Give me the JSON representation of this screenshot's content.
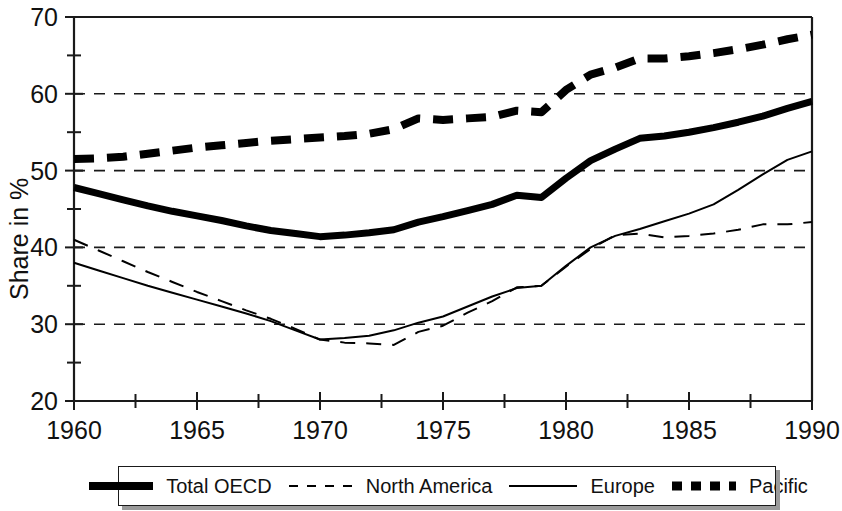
{
  "chart_data": {
    "type": "line",
    "title": "",
    "xlabel": "",
    "ylabel": "Share in %",
    "xlim": [
      1960,
      1990
    ],
    "ylim": [
      20,
      70
    ],
    "grid": "horizontal dashed gridlines at 30, 40, 50, 60",
    "legend_position": "bottom, boxed, horizontal",
    "y_ticks_major": [
      20,
      30,
      40,
      50,
      60,
      70
    ],
    "y_ticks_minor": [
      25,
      35,
      45,
      55,
      65
    ],
    "x_ticks_major": [
      1960,
      1965,
      1970,
      1975,
      1980,
      1985,
      1990
    ],
    "x_ticks_minor": [
      1962.5,
      1967.5,
      1972.5,
      1977.5,
      1982.5,
      1987.5
    ],
    "y_tick_labels": [
      "20",
      "30",
      "40",
      "50",
      "60",
      "70"
    ],
    "x_tick_labels": [
      "1960",
      "1965",
      "1970",
      "1975",
      "1980",
      "1985",
      "1990"
    ],
    "x": [
      1960,
      1961,
      1962,
      1963,
      1964,
      1965,
      1966,
      1967,
      1968,
      1969,
      1970,
      1971,
      1972,
      1973,
      1974,
      1975,
      1976,
      1977,
      1978,
      1979,
      1980,
      1981,
      1982,
      1983,
      1984,
      1985,
      1986,
      1987,
      1988,
      1989,
      1990
    ],
    "series": [
      {
        "name": "Total OECD",
        "style": "thick-solid",
        "color": "#000000",
        "values": [
          47.8,
          47.0,
          46.2,
          45.4,
          44.7,
          44.1,
          43.5,
          42.8,
          42.2,
          41.8,
          41.4,
          41.6,
          41.9,
          42.3,
          43.3,
          44.0,
          44.8,
          45.6,
          46.8,
          46.5,
          49.0,
          51.3,
          52.8,
          54.2,
          54.5,
          55.0,
          55.6,
          56.3,
          57.1,
          58.1,
          59.0
        ]
      },
      {
        "name": "North America",
        "style": "thin-dashed",
        "color": "#000000",
        "values": [
          41.0,
          39.6,
          38.2,
          36.8,
          35.5,
          34.2,
          33.0,
          31.8,
          30.7,
          29.4,
          28.0,
          27.6,
          27.5,
          27.3,
          29.0,
          29.8,
          31.5,
          33.0,
          34.8,
          35.0,
          37.5,
          39.8,
          41.6,
          41.8,
          41.3,
          41.5,
          41.8,
          42.3,
          43.0,
          43.0,
          43.3
        ]
      },
      {
        "name": "Europe",
        "style": "thin-solid",
        "color": "#000000",
        "values": [
          38.0,
          37.0,
          36.0,
          35.0,
          34.1,
          33.2,
          32.3,
          31.4,
          30.4,
          29.2,
          28.0,
          28.2,
          28.5,
          29.2,
          30.2,
          31.0,
          32.3,
          33.6,
          34.7,
          35.0,
          37.6,
          40.0,
          41.5,
          42.4,
          43.4,
          44.4,
          45.6,
          47.5,
          49.5,
          51.4,
          52.5
        ]
      },
      {
        "name": "Pacific",
        "style": "thick-dashed",
        "color": "#000000",
        "values": [
          51.5,
          51.6,
          51.8,
          52.2,
          52.6,
          53.0,
          53.3,
          53.6,
          53.9,
          54.1,
          54.3,
          54.5,
          54.8,
          55.4,
          56.8,
          56.6,
          56.8,
          57.0,
          57.8,
          57.6,
          60.5,
          62.5,
          63.4,
          64.6,
          64.6,
          64.9,
          65.3,
          65.8,
          66.4,
          67.1,
          67.7
        ]
      }
    ]
  },
  "legend": {
    "entries": [
      {
        "label": "Total OECD",
        "marker": "thick-solid-line-swatch"
      },
      {
        "label": "North America",
        "marker": "dashed-line-swatch"
      },
      {
        "label": "Europe",
        "marker": "thin-solid-line-swatch"
      },
      {
        "label": "Pacific",
        "marker": "thick-dashed-squares-swatch"
      }
    ]
  }
}
